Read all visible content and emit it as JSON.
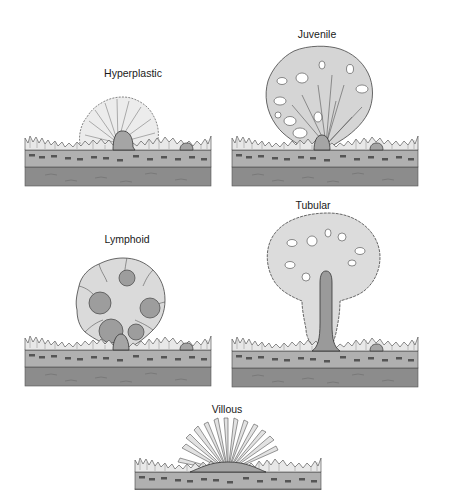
{
  "figure": {
    "panels": [
      {
        "id": "hyperplastic",
        "label": "Hyperplastic"
      },
      {
        "id": "juvenile",
        "label": "Juvenile"
      },
      {
        "id": "lymphoid",
        "label": "Lymphoid"
      },
      {
        "id": "tubular",
        "label": "Tubular"
      },
      {
        "id": "villous",
        "label": "Villous"
      }
    ],
    "colors": {
      "background": "#ffffff",
      "outline": "#3a3a3a",
      "polyp_fill": "#d9d9d9",
      "mucosa_fill": "#e6e6e6",
      "submucosa_fill": "#a9a9a9",
      "muscle_fill": "#8a8a8a",
      "stalk_fill": "#9a9a9a",
      "follicle_fill": "#9d9d9d"
    }
  }
}
